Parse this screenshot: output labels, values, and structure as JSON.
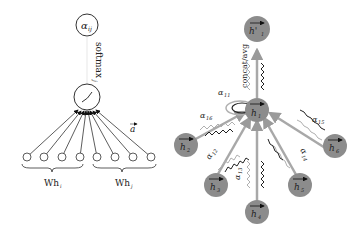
{
  "left_panel": {
    "output_node_label": "α",
    "output_node_sub": "ij",
    "softmax_label": "softmax",
    "softmax_sub": "j",
    "attention_vector_label": "a",
    "left_group_label": "Wh",
    "left_group_sub": "i",
    "right_group_label": "Wh",
    "right_group_sub": "j",
    "input_node_count": 8
  },
  "right_panel": {
    "output_node_label": "h'",
    "output_node_sub": "1",
    "aggregate_label": "concat/avg",
    "center_node_label": "h",
    "center_node_sub": "1",
    "neighbors": [
      {
        "label": "h",
        "sub": "2"
      },
      {
        "label": "h",
        "sub": "3"
      },
      {
        "label": "h",
        "sub": "4"
      },
      {
        "label": "h",
        "sub": "5"
      },
      {
        "label": "h",
        "sub": "6"
      }
    ],
    "edge_labels": [
      {
        "label": "α",
        "sub": "11"
      },
      {
        "label": "α",
        "sub": "12"
      },
      {
        "label": "α",
        "sub": "13"
      },
      {
        "label": "α",
        "sub": "14"
      },
      {
        "label": "α",
        "sub": "15"
      },
      {
        "label": "α",
        "sub": "16"
      }
    ],
    "colors": {
      "node_fill": "#8c8c8c",
      "arrow_gray": "#a8a8a8",
      "wave_dark": "#222222",
      "wave_light": "#b0b0b0"
    }
  }
}
